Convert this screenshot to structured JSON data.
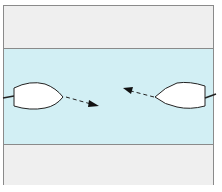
{
  "diagram": {
    "type": "river-crossing-boats",
    "regions": [
      {
        "name": "top-bank",
        "color": "#efefef"
      },
      {
        "name": "water",
        "color": "#d2eff4"
      },
      {
        "name": "bottom-bank",
        "color": "#efefef"
      }
    ],
    "boats": [
      {
        "name": "left-boat",
        "facing": "right",
        "fill": "#ffffff",
        "stroke": "#222222"
      },
      {
        "name": "right-boat",
        "facing": "left",
        "fill": "#ffffff",
        "stroke": "#222222"
      }
    ],
    "arrows": [
      {
        "name": "left-boat-direction",
        "style": "dashed",
        "direction": "down-right"
      },
      {
        "name": "right-boat-direction",
        "style": "dashed",
        "direction": "up-left"
      }
    ],
    "border_color": "#8a8a8a"
  }
}
